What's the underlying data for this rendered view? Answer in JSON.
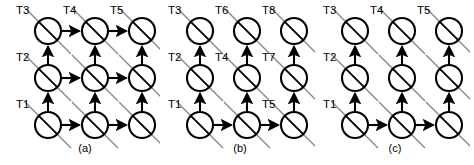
{
  "figure": {
    "background_color": "#ffffff",
    "node_color": "#ffffff",
    "edge_color": "#000000",
    "diagonal_color": "#8a8a8a",
    "node_radius": 13,
    "panel_count": 3
  },
  "chart_data": {
    "type": "diagram",
    "title": "",
    "panels": [
      {
        "id": "a",
        "caption": "(a)",
        "caption_x": 85,
        "caption_y": 152,
        "origin_x": 48,
        "origin_y": 125,
        "col_spacing": 47,
        "row_spacing": 47,
        "rows": 3,
        "cols": 3,
        "horizontal_arrow_rows": [
          0,
          1,
          2
        ],
        "vertical_arrow_cols": [
          0,
          1,
          2
        ],
        "labels": [
          {
            "text": "T1",
            "x": 16,
            "y": 108,
            "node_row": 0,
            "node_col": 0
          },
          {
            "text": "T2",
            "x": 16,
            "y": 61,
            "node_row": 1,
            "node_col": 0
          },
          {
            "text": "T3",
            "x": 16,
            "y": 14,
            "node_row": 2,
            "node_col": 0
          },
          {
            "text": "T4",
            "x": 63,
            "y": 14,
            "node_row": 2,
            "node_col": 1
          },
          {
            "text": "T5",
            "x": 110,
            "y": 14,
            "node_row": 2,
            "node_col": 2
          }
        ]
      },
      {
        "id": "b",
        "caption": "(b)",
        "caption_x": 85,
        "caption_y": 152,
        "origin_x": 45,
        "origin_y": 125,
        "col_spacing": 47,
        "row_spacing": 47,
        "rows": 3,
        "cols": 3,
        "horizontal_arrow_rows": [
          0
        ],
        "vertical_arrow_cols": [
          0,
          1,
          2
        ],
        "labels": [
          {
            "text": "T1",
            "x": 13,
            "y": 108,
            "node_row": 0,
            "node_col": 0
          },
          {
            "text": "T5",
            "x": 107,
            "y": 108,
            "node_row": 0,
            "node_col": 2
          },
          {
            "text": "T2",
            "x": 13,
            "y": 61,
            "node_row": 1,
            "node_col": 0
          },
          {
            "text": "T4",
            "x": 60,
            "y": 61,
            "node_row": 1,
            "node_col": 1
          },
          {
            "text": "T7",
            "x": 107,
            "y": 61,
            "node_row": 1,
            "node_col": 2
          },
          {
            "text": "T3",
            "x": 13,
            "y": 14,
            "node_row": 2,
            "node_col": 0
          },
          {
            "text": "T6",
            "x": 60,
            "y": 14,
            "node_row": 2,
            "node_col": 1
          },
          {
            "text": "T8",
            "x": 107,
            "y": 14,
            "node_row": 2,
            "node_col": 2
          }
        ]
      },
      {
        "id": "c",
        "caption": "(c)",
        "caption_x": 85,
        "caption_y": 152,
        "origin_x": 45,
        "origin_y": 125,
        "col_spacing": 47,
        "row_spacing": 47,
        "rows": 3,
        "cols": 3,
        "horizontal_arrow_rows": [
          0
        ],
        "vertical_arrow_cols": [
          0,
          1,
          2
        ],
        "labels": [
          {
            "text": "T1",
            "x": 13,
            "y": 108,
            "node_row": 0,
            "node_col": 0
          },
          {
            "text": "T2",
            "x": 13,
            "y": 61,
            "node_row": 1,
            "node_col": 0
          },
          {
            "text": "T3",
            "x": 13,
            "y": 14,
            "node_row": 2,
            "node_col": 0
          },
          {
            "text": "T4",
            "x": 60,
            "y": 14,
            "node_row": 2,
            "node_col": 1
          },
          {
            "text": "T5",
            "x": 107,
            "y": 14,
            "node_row": 2,
            "node_col": 2
          }
        ]
      }
    ]
  }
}
